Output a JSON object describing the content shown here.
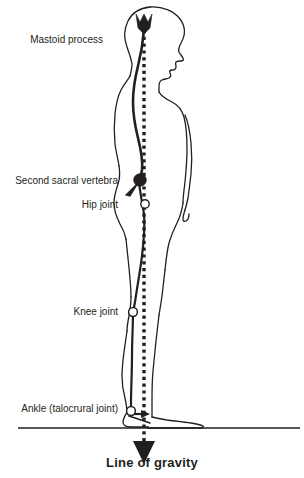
{
  "figure": {
    "caption": "Line of gravity",
    "background_color": "#ffffff",
    "ink_color": "#231f20"
  },
  "labels": [
    {
      "id": "mastoid-process",
      "text": "Mastoid process",
      "x": 103,
      "y": 34,
      "align": "right",
      "marker": "black-arrowhead"
    },
    {
      "id": "second-sacral-vertebra",
      "text": "Second sacral vertebra",
      "x": 118,
      "y": 175,
      "align": "right",
      "marker": "filled-circle-with-tail"
    },
    {
      "id": "hip-joint",
      "text": "Hip joint",
      "x": 118,
      "y": 199,
      "align": "right",
      "marker": "open-circle"
    },
    {
      "id": "knee-joint",
      "text": "Knee joint",
      "x": 118,
      "y": 306,
      "align": "right",
      "marker": "open-circle"
    },
    {
      "id": "ankle-talocrural-joint",
      "text": "Ankle (talocrural joint)",
      "x": 118,
      "y": 403,
      "align": "right",
      "marker": "open-circle-with-arrow"
    }
  ],
  "graphic": {
    "body_outline_name": "lateral-human-body-silhouette",
    "gravity_line": {
      "name": "line-of-gravity",
      "style": "dotted",
      "x": 144,
      "y_top": 30,
      "y_bottom": 440,
      "arrow_at_bottom": true
    },
    "ground_line": {
      "name": "ground-line",
      "x_start": 18,
      "x_end": 300,
      "y": 425
    },
    "spine_curve_name": "vertebral-column-curve",
    "joint_markers": [
      {
        "name": "mastoid-process-marker",
        "x": 144,
        "y": 22,
        "type": "black-arrowhead"
      },
      {
        "name": "second-sacral-vertebra-marker",
        "x": 140,
        "y": 180,
        "type": "filled-circle"
      },
      {
        "name": "hip-joint-marker",
        "x": 145,
        "y": 204,
        "type": "open-circle"
      },
      {
        "name": "knee-joint-marker",
        "x": 133,
        "y": 312,
        "type": "open-circle"
      },
      {
        "name": "ankle-joint-marker",
        "x": 131,
        "y": 411,
        "type": "open-circle"
      }
    ]
  }
}
